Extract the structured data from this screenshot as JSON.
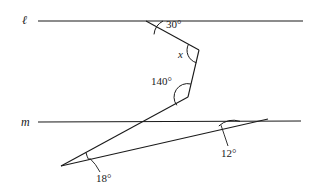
{
  "figure": {
    "stroke_color": "#1a1a1a",
    "background": "#ffffff",
    "line_labels": {
      "upper": "ℓ",
      "lower": "m"
    },
    "angles": [
      {
        "id": "a30",
        "label": "30°",
        "value": 30,
        "unit": "degrees",
        "at": "upper-line-vertex"
      },
      {
        "id": "ax",
        "label": "x",
        "value": null,
        "unit": "degrees",
        "at": "upper-zigzag-vertex"
      },
      {
        "id": "a140",
        "label": "140°",
        "value": 140,
        "unit": "degrees",
        "at": "lower-zigzag-vertex"
      },
      {
        "id": "a18",
        "label": "18°",
        "value": 18,
        "unit": "degrees",
        "at": "bottom-left-vertex"
      },
      {
        "id": "a12",
        "label": "12°",
        "value": 12,
        "unit": "degrees",
        "at": "lower-line-vertex"
      }
    ]
  }
}
